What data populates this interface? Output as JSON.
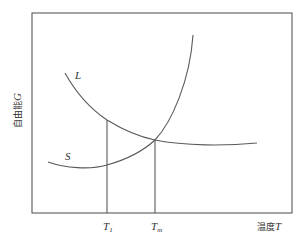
{
  "diagram": {
    "title": "",
    "y_axis": {
      "label_text": "自由能",
      "label_symbol": "G"
    },
    "x_axis": {
      "label_text": "温度",
      "label_symbol": "T"
    },
    "curves": [
      {
        "id": "liquid",
        "label": "L"
      },
      {
        "id": "solid",
        "label": "S"
      }
    ],
    "markers": [
      {
        "id": "t1",
        "symbol": "T",
        "subscript": "1"
      },
      {
        "id": "tm",
        "symbol": "T",
        "subscript": "m"
      }
    ],
    "line_color": "#5a5a5a"
  }
}
